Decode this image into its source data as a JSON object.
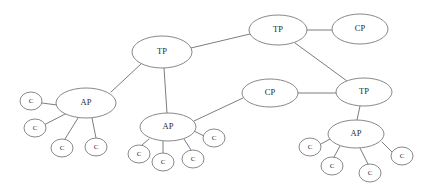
{
  "diagram": {
    "type": "node-link-graph",
    "background_color": "#ffffff",
    "edge_color": "#6e6e6e",
    "node_stroke_color": "#7a7a7a",
    "node_fill_color": "#ffffff",
    "label_color": "#2b2b2b",
    "node_type_legend": {
      "TP": "Transit Point",
      "CP": "Client Point",
      "AP": "Access Point",
      "C": "Client"
    },
    "nodes": [
      {
        "id": "tp1",
        "label": "TP",
        "x": 162,
        "y": 52,
        "rx": 30,
        "ry": 16,
        "size": "large"
      },
      {
        "id": "tp2",
        "label": "TP",
        "x": 278,
        "y": 30,
        "rx": 29,
        "ry": 15,
        "size": "large"
      },
      {
        "id": "cp1",
        "label": "CP",
        "x": 360,
        "y": 29,
        "rx": 28,
        "ry": 15,
        "size": "large"
      },
      {
        "id": "tp3",
        "label": "TP",
        "x": 364,
        "y": 92,
        "rx": 28,
        "ry": 14,
        "size": "large"
      },
      {
        "id": "cp2",
        "label": "CP",
        "x": 270,
        "y": 93,
        "rx": 28,
        "ry": 14,
        "size": "large"
      },
      {
        "id": "ap1",
        "label": "AP",
        "x": 86,
        "y": 103,
        "rx": 30,
        "ry": 15,
        "size": "large"
      },
      {
        "id": "ap2",
        "label": "AP",
        "x": 168,
        "y": 127,
        "rx": 28,
        "ry": 14,
        "size": "large"
      },
      {
        "id": "ap3",
        "label": "AP",
        "x": 356,
        "y": 134,
        "rx": 28,
        "ry": 14,
        "size": "large"
      },
      {
        "id": "c1",
        "label": "C",
        "x": 31,
        "y": 101,
        "rx": 11,
        "ry": 9,
        "size": "small"
      },
      {
        "id": "c2",
        "label": "C",
        "x": 35,
        "y": 128,
        "rx": 11,
        "ry": 9,
        "size": "small"
      },
      {
        "id": "c3",
        "label": "C",
        "x": 62,
        "y": 148,
        "rx": 11,
        "ry": 9,
        "size": "small"
      },
      {
        "id": "c4",
        "label": "C",
        "x": 96,
        "y": 147,
        "rx": 11,
        "ry": 9,
        "size": "small"
      },
      {
        "id": "c5",
        "label": "C",
        "x": 139,
        "y": 154,
        "rx": 11,
        "ry": 9,
        "size": "small"
      },
      {
        "id": "c6",
        "label": "C",
        "x": 163,
        "y": 162,
        "rx": 11,
        "ry": 9,
        "size": "small"
      },
      {
        "id": "c7",
        "label": "C",
        "x": 193,
        "y": 159,
        "rx": 11,
        "ry": 9,
        "size": "small"
      },
      {
        "id": "c8",
        "label": "C",
        "x": 214,
        "y": 138,
        "rx": 11,
        "ry": 9,
        "size": "small"
      },
      {
        "id": "c9",
        "label": "C",
        "x": 310,
        "y": 147,
        "rx": 11,
        "ry": 9,
        "size": "small"
      },
      {
        "id": "c10",
        "label": "C",
        "x": 332,
        "y": 166,
        "rx": 11,
        "ry": 9,
        "size": "small"
      },
      {
        "id": "c11",
        "label": "C",
        "x": 370,
        "y": 173,
        "rx": 11,
        "ry": 9,
        "size": "small"
      },
      {
        "id": "c12",
        "label": "C",
        "x": 402,
        "y": 156,
        "rx": 11,
        "ry": 9,
        "size": "small"
      }
    ],
    "edges": [
      {
        "from": "tp1",
        "to": "tp2",
        "x1": 191,
        "y1": 48,
        "x2": 250,
        "y2": 34
      },
      {
        "from": "tp2",
        "to": "cp1",
        "x1": 307,
        "y1": 30,
        "x2": 332,
        "y2": 30
      },
      {
        "from": "tp2",
        "to": "tp3",
        "x1": 295,
        "y1": 43,
        "x2": 347,
        "y2": 81
      },
      {
        "from": "tp3",
        "to": "cp2",
        "x1": 336,
        "y1": 93,
        "x2": 298,
        "y2": 93
      },
      {
        "from": "tp3",
        "to": "ap3",
        "x1": 360,
        "y1": 106,
        "x2": 357,
        "y2": 120
      },
      {
        "from": "tp1",
        "to": "ap1",
        "x1": 141,
        "y1": 64,
        "x2": 111,
        "y2": 92
      },
      {
        "from": "tp1",
        "to": "ap2",
        "x1": 164,
        "y1": 68,
        "x2": 167,
        "y2": 113
      },
      {
        "from": "ap2",
        "to": "cp2",
        "x1": 194,
        "y1": 121,
        "x2": 243,
        "y2": 98
      },
      {
        "from": "ap1",
        "to": "c1",
        "x1": 57,
        "y1": 105,
        "x2": 42,
        "y2": 103
      },
      {
        "from": "ap1",
        "to": "c2",
        "x1": 67,
        "y1": 113,
        "x2": 44,
        "y2": 125
      },
      {
        "from": "ap1",
        "to": "c3",
        "x1": 78,
        "y1": 118,
        "x2": 65,
        "y2": 139
      },
      {
        "from": "ap1",
        "to": "c4",
        "x1": 92,
        "y1": 118,
        "x2": 96,
        "y2": 138
      },
      {
        "from": "ap2",
        "to": "c5",
        "x1": 149,
        "y1": 139,
        "x2": 142,
        "y2": 145
      },
      {
        "from": "ap2",
        "to": "c6",
        "x1": 163,
        "y1": 141,
        "x2": 163,
        "y2": 153
      },
      {
        "from": "ap2",
        "to": "c7",
        "x1": 184,
        "y1": 139,
        "x2": 191,
        "y2": 150
      },
      {
        "from": "ap2",
        "to": "c8",
        "x1": 194,
        "y1": 131,
        "x2": 204,
        "y2": 136
      },
      {
        "from": "ap3",
        "to": "c9",
        "x1": 330,
        "y1": 139,
        "x2": 321,
        "y2": 144
      },
      {
        "from": "ap3",
        "to": "c10",
        "x1": 340,
        "y1": 146,
        "x2": 334,
        "y2": 157
      },
      {
        "from": "ap3",
        "to": "c11",
        "x1": 360,
        "y1": 148,
        "x2": 368,
        "y2": 164
      },
      {
        "from": "ap3",
        "to": "c12",
        "x1": 382,
        "y1": 142,
        "x2": 392,
        "y2": 152
      }
    ]
  }
}
